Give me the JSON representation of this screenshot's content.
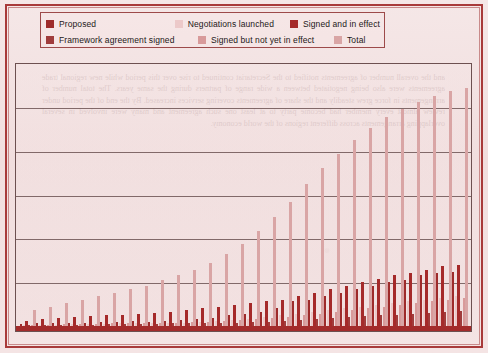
{
  "chart_data": {
    "type": "bar",
    "title": "",
    "subtitle": "",
    "xlabel": "",
    "ylabel": "",
    "grid": true,
    "gridlines": 5,
    "legend_position": "top",
    "ylim": [
      0,
      300
    ],
    "yticks": [
      0,
      50,
      100,
      150,
      200,
      250,
      300
    ],
    "categories": [
      "1",
      "2",
      "3",
      "4",
      "5",
      "6",
      "7",
      "8",
      "9",
      "10",
      "11",
      "12",
      "13",
      "14",
      "15",
      "16",
      "17",
      "18",
      "19",
      "20",
      "21",
      "22",
      "23",
      "24",
      "25",
      "26",
      "27",
      "28"
    ],
    "series": [
      {
        "name": "Proposed",
        "color": "#9e2b2b",
        "values": [
          2,
          3,
          3,
          4,
          4,
          5,
          5,
          6,
          5,
          6,
          7,
          8,
          9,
          12,
          14,
          16,
          20,
          28,
          30,
          34,
          38,
          42,
          46,
          50,
          52,
          58,
          60,
          62
        ]
      },
      {
        "name": "Negotiations launched",
        "color": "#ecc9c9",
        "values": [
          1,
          1,
          1,
          2,
          2,
          2,
          3,
          3,
          3,
          4,
          4,
          5,
          6,
          7,
          8,
          10,
          12,
          14,
          16,
          18,
          20,
          22,
          24,
          26,
          28,
          30,
          32,
          34
        ]
      },
      {
        "name": "Signed and in effect",
        "color": "#a52a2a",
        "values": [
          6,
          8,
          9,
          10,
          11,
          12,
          13,
          14,
          15,
          16,
          18,
          20,
          22,
          24,
          26,
          28,
          30,
          34,
          38,
          42,
          46,
          50,
          54,
          58,
          60,
          64,
          68,
          70
        ]
      },
      {
        "name": "Framework agreement signed",
        "color": "#a03c3c",
        "values": [
          1,
          1,
          1,
          1,
          1,
          2,
          2,
          2,
          2,
          3,
          3,
          3,
          4,
          4,
          5,
          5,
          6,
          7,
          8,
          9,
          10,
          11,
          12,
          13,
          14,
          15,
          16,
          17
        ]
      },
      {
        "name": "Signed but not yet in effect",
        "color": "#d89a9a",
        "values": [
          1,
          1,
          2,
          2,
          2,
          3,
          3,
          3,
          4,
          4,
          5,
          5,
          6,
          7,
          8,
          9,
          10,
          12,
          14,
          16,
          18,
          20,
          22,
          24,
          26,
          28,
          30,
          32
        ]
      },
      {
        "name": "Total",
        "color": "#d9a5a5",
        "values": [
          18,
          22,
          26,
          30,
          34,
          38,
          42,
          46,
          52,
          58,
          64,
          72,
          82,
          94,
          108,
          124,
          142,
          162,
          180,
          196,
          212,
          226,
          238,
          248,
          256,
          262,
          268,
          272
        ]
      }
    ]
  },
  "legend": {
    "rows": [
      [
        {
          "label": "Proposed",
          "color": "#9e2b2b"
        },
        {
          "label": "Negotiations launched",
          "color": "#ecc9c9"
        },
        {
          "label": "Signed and in effect",
          "color": "#a52a2a"
        }
      ],
      [
        {
          "label": "Framework agreement signed",
          "color": "#a03c3c"
        },
        {
          "label": "Signed but not yet in effect",
          "color": "#d89a9a"
        },
        {
          "label": "Total",
          "color": "#d9a5a5"
        }
      ]
    ]
  },
  "page": {
    "background_color": "#f3e3e3",
    "frame_color": "#a83a3a",
    "axis_band_color": "#a32b2b",
    "gridline_color": "#6d5353",
    "bleed_text": "and the overall number of agreements notified to the Secretariat continued to rise over this period while new regional trade agreements were also being negotiated between a wide range of partners during the same years. The total number of arrangements in force grew steadily and the share of agreements covering services increased. By the end of the period under review almost every member had become party to at least one such agreement and many were involved in several overlapping arrangements across different regions of the world economy."
  }
}
